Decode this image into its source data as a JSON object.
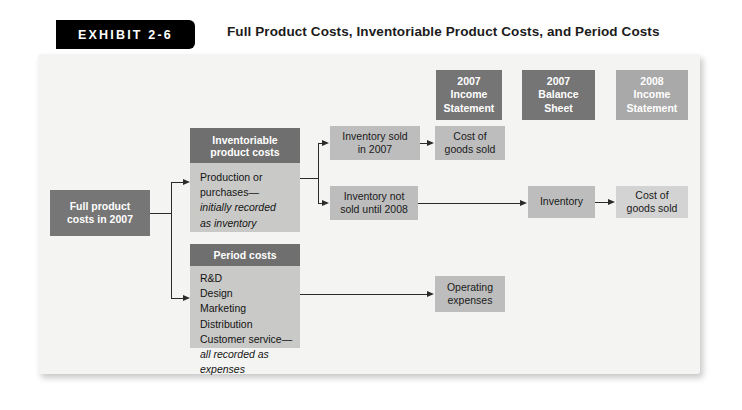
{
  "exhibit": {
    "tag": "EXHIBIT 2-6",
    "title": "Full Product Costs, Inventoriable Product Costs, and Period Costs"
  },
  "colors": {
    "panel_bg": "#f4f4f2",
    "header_dark": "#757575",
    "header_light": "#a9a9a9",
    "box_dark": "#767676",
    "box_mid": "#bdbdbd",
    "box_light": "#d3d3d3",
    "group_body": "#c9c9c7",
    "line": "#2b2b2b",
    "tag_bg": "#000000"
  },
  "statement_headers": [
    {
      "line1": "2007",
      "line2": "Income",
      "line3": "Statement",
      "shade": "dark"
    },
    {
      "line1": "2007",
      "line2": "Balance",
      "line3": "Sheet",
      "shade": "dark"
    },
    {
      "line1": "2008",
      "line2": "Income",
      "line3": "Statement",
      "shade": "light"
    }
  ],
  "source": {
    "line1": "Full product",
    "line2": "costs in 2007"
  },
  "inventoriable": {
    "header": "Inventoriable product costs",
    "header_line1": "Inventoriable",
    "header_line2": "product costs",
    "body_lines": [
      {
        "text": "Production or",
        "italic": false
      },
      {
        "text": "purchases—",
        "italic": false
      },
      {
        "text": "initially recorded",
        "italic": true
      },
      {
        "text": "as inventory",
        "italic": true
      }
    ]
  },
  "period": {
    "header": "Period costs",
    "body_lines": [
      {
        "text": "R&D",
        "italic": false
      },
      {
        "text": "Design",
        "italic": false
      },
      {
        "text": "Marketing",
        "italic": false
      },
      {
        "text": "Distribution",
        "italic": false
      },
      {
        "text": "Customer service—",
        "italic": false
      },
      {
        "text": "all recorded as",
        "italic": true
      },
      {
        "text": "expenses",
        "italic": true
      }
    ]
  },
  "flow_boxes": {
    "inventory_sold_2007": {
      "line1": "Inventory sold",
      "line2": "in 2007",
      "shade": "mid"
    },
    "cogs_2007": {
      "line1": "Cost of",
      "line2": "goods sold",
      "shade": "mid"
    },
    "inventory_not_sold": {
      "line1": "Inventory not",
      "line2": "sold until 2008",
      "shade": "mid"
    },
    "inventory": {
      "line1": "Inventory",
      "line2": "",
      "shade": "mid"
    },
    "cogs_2008": {
      "line1": "Cost of",
      "line2": "goods sold",
      "shade": "light"
    },
    "operating_expenses": {
      "line1": "Operating",
      "line2": "expenses",
      "shade": "mid"
    }
  }
}
